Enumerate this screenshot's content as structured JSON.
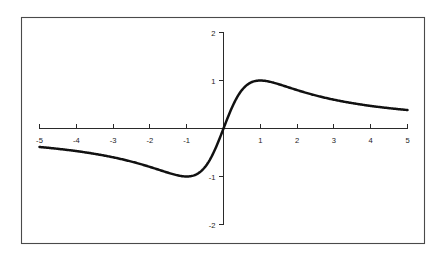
{
  "figure": {
    "background_color": "#ffffff",
    "frame": {
      "stroke_color": "#4a4a4a",
      "x": 21,
      "y": 17,
      "width": 403,
      "height": 226
    }
  },
  "chart_data": {
    "type": "line",
    "title": "",
    "subtitle": "",
    "xlabel": "",
    "ylabel": "",
    "expression": "2x/(1+x^2)",
    "curve_color": "#111111",
    "axis_color": "#2a2a2a",
    "grid": false,
    "legend": null,
    "annotations": [],
    "xlim": [
      -5,
      5
    ],
    "ylim": [
      -2,
      2
    ],
    "xticks": [
      -5,
      -4,
      -3,
      -2,
      -1,
      1,
      2,
      3,
      4,
      5
    ],
    "xticklabels": [
      "-5",
      "-4",
      "-3",
      "-2",
      "-1",
      "1",
      "2",
      "3",
      "4",
      "5"
    ],
    "yticks": [
      2,
      1,
      -1,
      -2
    ],
    "yticklabels": [
      "2",
      "1",
      "-1",
      "-2"
    ],
    "x": [
      -5,
      -4.75,
      -4.5,
      -4.25,
      -4,
      -3.75,
      -3.5,
      -3.25,
      -3,
      -2.75,
      -2.5,
      -2.25,
      -2,
      -1.75,
      -1.5,
      -1.25,
      -1,
      -0.75,
      -0.5,
      -0.25,
      0,
      0.25,
      0.5,
      0.75,
      1,
      1.25,
      1.5,
      1.75,
      2,
      2.25,
      2.5,
      2.75,
      3,
      3.25,
      3.5,
      3.75,
      4,
      4.25,
      4.5,
      4.75,
      5
    ],
    "y": [
      -0.385,
      -0.401,
      -0.419,
      -0.438,
      -0.459,
      -0.483,
      -0.508,
      -0.536,
      -0.6,
      -0.604,
      -0.638,
      -0.675,
      -0.8,
      -0.757,
      -0.8,
      -0.838,
      -1,
      -0.96,
      -0.8,
      -0.471,
      0,
      0.471,
      0.8,
      0.96,
      1,
      0.976,
      0.923,
      0.86,
      0.8,
      0.742,
      0.69,
      0.643,
      0.6,
      0.562,
      0.528,
      0.497,
      0.471,
      0.446,
      0.424,
      0.404,
      0.385
    ],
    "series": [
      {
        "name": "2x/(1+x^2)",
        "values": [
          -0.385,
          -0.401,
          -0.419,
          -0.438,
          -0.459,
          -0.483,
          -0.508,
          -0.536,
          -0.6,
          -0.604,
          -0.638,
          -0.675,
          -0.8,
          -0.757,
          -0.8,
          -0.838,
          -1,
          -0.96,
          -0.8,
          -0.471,
          0,
          0.471,
          0.8,
          0.96,
          1,
          0.976,
          0.923,
          0.86,
          0.8,
          0.742,
          0.69,
          0.643,
          0.6,
          0.562,
          0.528,
          0.497,
          0.471,
          0.446,
          0.424,
          0.404,
          0.385
        ]
      }
    ],
    "key_points": {
      "maximum": {
        "x": 1,
        "y": 1
      },
      "minimum": {
        "x": -1,
        "y": -1
      },
      "origin_crossing": {
        "x": 0,
        "y": 0
      },
      "left_endpoint": {
        "x": -5,
        "y": -0.385
      },
      "right_endpoint": {
        "x": 5,
        "y": 0.385
      }
    }
  }
}
